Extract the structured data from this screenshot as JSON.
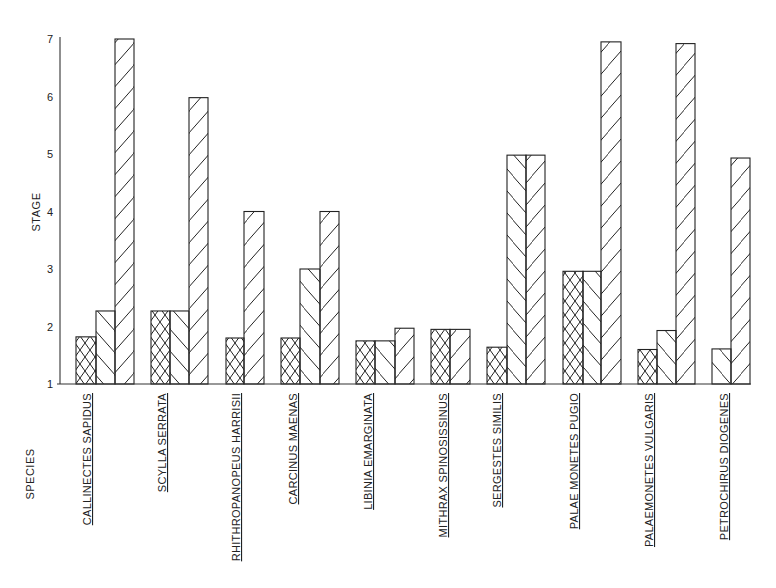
{
  "chart_data": {
    "type": "bar",
    "title": "",
    "xlabel": "SPECIES",
    "ylabel": "STAGE",
    "ylim": [
      1,
      7
    ],
    "yticks": [
      1,
      2,
      3,
      4,
      5,
      6,
      7
    ],
    "grid": false,
    "legend": "none (bars distinguished by hatch pattern: cross-hatch, back-slash, forward-slash)",
    "categories": [
      "CALLINECTES SAPIDUS",
      "SCYLLA SERRATA",
      "RHITHROPANOPEUS HARRISII",
      "CARCINUS MAENAS",
      "LIBINIA EMARGINATA",
      "MITHRAX SPINOSISSINUS",
      "SERGESTES SIMILIS",
      "PALAE MONETES PUGIO",
      "PALAEMONETES VULGARIS",
      "PETROCHIRUS DIOGENES"
    ],
    "series": [
      {
        "name": "cross-hatch",
        "pattern": "crosshatch",
        "values": [
          1.82,
          2.27,
          1.8,
          1.8,
          1.75,
          1.95,
          1.64,
          2.96,
          1.6,
          null
        ]
      },
      {
        "name": "back-slash",
        "pattern": "backslash",
        "values": [
          2.27,
          2.27,
          null,
          3.0,
          1.75,
          null,
          4.98,
          2.96,
          1.93,
          1.61
        ]
      },
      {
        "name": "forward-slash",
        "pattern": "slash",
        "values": [
          7.0,
          5.98,
          4.0,
          4.0,
          1.97,
          1.95,
          4.98,
          6.95,
          6.92,
          4.93
        ]
      }
    ],
    "bars": [
      {
        "group": 0,
        "pattern": "crosshatch",
        "x": 76,
        "w": 20,
        "value": 1.82
      },
      {
        "group": 0,
        "pattern": "backslash",
        "x": 96,
        "w": 19,
        "value": 2.27
      },
      {
        "group": 0,
        "pattern": "slash",
        "x": 115,
        "w": 19,
        "value": 7.0
      },
      {
        "group": 1,
        "pattern": "crosshatch",
        "x": 151,
        "w": 19,
        "value": 2.27
      },
      {
        "group": 1,
        "pattern": "backslash",
        "x": 170,
        "w": 19,
        "value": 2.27
      },
      {
        "group": 1,
        "pattern": "slash",
        "x": 189,
        "w": 19,
        "value": 5.98
      },
      {
        "group": 2,
        "pattern": "crosshatch",
        "x": 226,
        "w": 18,
        "value": 1.8
      },
      {
        "group": 2,
        "pattern": "slash",
        "x": 244,
        "w": 20,
        "value": 4.0
      },
      {
        "group": 3,
        "pattern": "crosshatch",
        "x": 281,
        "w": 19,
        "value": 1.8
      },
      {
        "group": 3,
        "pattern": "backslash",
        "x": 300,
        "w": 20,
        "value": 3.0
      },
      {
        "group": 3,
        "pattern": "slash",
        "x": 320,
        "w": 19,
        "value": 4.0
      },
      {
        "group": 4,
        "pattern": "crosshatch",
        "x": 356,
        "w": 19,
        "value": 1.75
      },
      {
        "group": 4,
        "pattern": "backslash",
        "x": 375,
        "w": 20,
        "value": 1.75
      },
      {
        "group": 4,
        "pattern": "slash",
        "x": 395,
        "w": 19,
        "value": 1.97
      },
      {
        "group": 5,
        "pattern": "crosshatch",
        "x": 431,
        "w": 19,
        "value": 1.95
      },
      {
        "group": 5,
        "pattern": "slash",
        "x": 450,
        "w": 20,
        "value": 1.95
      },
      {
        "group": 6,
        "pattern": "crosshatch",
        "x": 487,
        "w": 20,
        "value": 1.64
      },
      {
        "group": 6,
        "pattern": "backslash",
        "x": 507,
        "w": 19,
        "value": 4.98
      },
      {
        "group": 6,
        "pattern": "slash",
        "x": 526,
        "w": 19,
        "value": 4.98
      },
      {
        "group": 7,
        "pattern": "crosshatch",
        "x": 563,
        "w": 20,
        "value": 2.96
      },
      {
        "group": 7,
        "pattern": "backslash",
        "x": 583,
        "w": 18,
        "value": 2.96
      },
      {
        "group": 7,
        "pattern": "slash",
        "x": 601,
        "w": 20,
        "value": 6.95
      },
      {
        "group": 8,
        "pattern": "crosshatch",
        "x": 638,
        "w": 19,
        "value": 1.6
      },
      {
        "group": 8,
        "pattern": "backslash",
        "x": 657,
        "w": 19,
        "value": 1.93
      },
      {
        "group": 8,
        "pattern": "slash",
        "x": 676,
        "w": 19,
        "value": 6.92
      },
      {
        "group": 9,
        "pattern": "backslash",
        "x": 712,
        "w": 19,
        "value": 1.61
      },
      {
        "group": 9,
        "pattern": "slash",
        "x": 731,
        "w": 19,
        "value": 4.93
      }
    ],
    "labels": [
      {
        "text": "CALLINECTES SAPIDUS",
        "x": 87,
        "top": 393
      },
      {
        "text": "SCYLLA SERRATA",
        "x": 162,
        "top": 393
      },
      {
        "text": "RHITHROPANOPEUS HARRISII",
        "x": 236,
        "top": 393
      },
      {
        "text": "CARCINUS MAENAS",
        "x": 293,
        "top": 393
      },
      {
        "text": "LIBINIA EMARGINATA",
        "x": 368,
        "top": 393
      },
      {
        "text": "MITHRAX SPINOSISSINUS",
        "x": 443,
        "top": 393
      },
      {
        "text": "SERGESTES SIMILIS",
        "x": 497,
        "top": 393
      },
      {
        "text": "PALAE MONETES PUGIO",
        "x": 574,
        "top": 393
      },
      {
        "text": "PALAEMONETES VULGARIS",
        "x": 649,
        "top": 393
      },
      {
        "text": "PETROCHIRUS DIOGENES",
        "x": 724,
        "top": 393
      }
    ]
  },
  "axes": {
    "y_title": "STAGE",
    "x_title": "SPECIES",
    "y_tick_labels": [
      "7",
      "6",
      "5",
      "4",
      "3",
      "2",
      "1"
    ]
  }
}
